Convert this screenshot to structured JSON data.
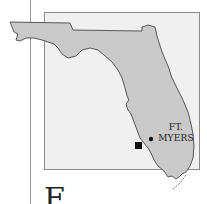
{
  "map": {
    "region": "Florida",
    "city_label_line1": "FT.",
    "city_label_line2": "MYERS",
    "markers": [
      {
        "type": "city-dot",
        "label": "FT. MYERS"
      },
      {
        "type": "site-square"
      }
    ],
    "colors": {
      "land": "#c9c9c9",
      "frame_background": "#f0f0f0",
      "outline": "#333333",
      "marker": "#111111"
    }
  },
  "text": {
    "drop_cap": "F"
  }
}
